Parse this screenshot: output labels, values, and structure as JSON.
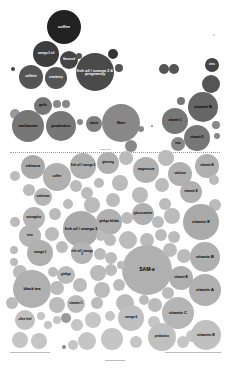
{
  "chart_data": {
    "type": "bubble",
    "title": "",
    "divider_label": "worth it line",
    "bubbles": [
      {
        "label": "coffee",
        "x": 64,
        "y": 27,
        "r": 17,
        "color": "#222222",
        "text": "#ffffff"
      },
      {
        "label": "omega-3 oil",
        "x": 46,
        "y": 54,
        "r": 13,
        "color": "#3d3d3d",
        "text": "#ffffff"
      },
      {
        "label": "flaxseed",
        "x": 69,
        "y": 60,
        "r": 9,
        "color": "#444444",
        "text": "#ffffff"
      },
      {
        "label": "",
        "x": 79,
        "y": 56,
        "r": 3,
        "color": "#555555",
        "text": "#ffffff"
      },
      {
        "label": "fish oil / omega 3 & pregnancy",
        "x": 95,
        "y": 72,
        "r": 19,
        "color": "#4a4a4a",
        "text": "#ffffff"
      },
      {
        "label": "",
        "x": 113,
        "y": 54,
        "r": 5,
        "color": "#333333",
        "text": "#ffffff"
      },
      {
        "label": "",
        "x": 119,
        "y": 68,
        "r": 4,
        "color": "#555555",
        "text": "#ffffff"
      },
      {
        "label": "",
        "x": 13,
        "y": 69,
        "r": 2,
        "color": "#444444",
        "text": "#ffffff"
      },
      {
        "label": "caffeine",
        "x": 31,
        "y": 77,
        "r": 12,
        "color": "#555555",
        "text": "#ffffff"
      },
      {
        "label": "cranberry",
        "x": 56,
        "y": 78,
        "r": 11,
        "color": "#555555",
        "text": "#ffffff"
      },
      {
        "label": "",
        "x": 164,
        "y": 69,
        "r": 5,
        "color": "#555555",
        "text": "#ffffff"
      },
      {
        "label": "",
        "x": 174,
        "y": 69,
        "r": 5,
        "color": "#555555",
        "text": "#ffffff"
      },
      {
        "label": "zinc",
        "x": 212,
        "y": 65,
        "r": 7,
        "color": "#444444",
        "text": "#ffffff"
      },
      {
        "label": "",
        "x": 211,
        "y": 84,
        "r": 9,
        "color": "#555555",
        "text": "#ffffff"
      },
      {
        "label": "vitamin B",
        "x": 203,
        "y": 107,
        "r": 15,
        "color": "#666666",
        "text": "#000000"
      },
      {
        "label": "",
        "x": 181,
        "y": 101,
        "r": 4,
        "color": "#777777",
        "text": "#000000"
      },
      {
        "label": "garlic",
        "x": 43,
        "y": 106,
        "r": 9,
        "color": "#777777",
        "text": "#000000"
      },
      {
        "label": "",
        "x": 57,
        "y": 104,
        "r": 4,
        "color": "#888888",
        "text": "#000000"
      },
      {
        "label": "",
        "x": 66,
        "y": 104,
        "r": 4,
        "color": "#888888",
        "text": "#000000"
      },
      {
        "label": "",
        "x": 15,
        "y": 114,
        "r": 5,
        "color": "#999999",
        "text": "#000000"
      },
      {
        "label": "melatonin",
        "x": 28,
        "y": 126,
        "r": 16,
        "color": "#777777",
        "text": "#000000"
      },
      {
        "label": "probiotics",
        "x": 61,
        "y": 126,
        "r": 15,
        "color": "#777777",
        "text": "#000000"
      },
      {
        "label": "",
        "x": 80,
        "y": 122,
        "r": 3,
        "color": "#888888",
        "text": "#000000"
      },
      {
        "label": "niacin",
        "x": 94,
        "y": 124,
        "r": 8,
        "color": "#808080",
        "text": "#000000"
      },
      {
        "label": "fiber",
        "x": 121,
        "y": 123,
        "r": 19,
        "color": "#888888",
        "text": "#000000"
      },
      {
        "label": "",
        "x": 141,
        "y": 129,
        "r": 3,
        "color": "#888888",
        "text": "#000000"
      },
      {
        "label": "",
        "x": 152,
        "y": 126,
        "r": 1,
        "color": "#888888",
        "text": "#000000"
      },
      {
        "label": "vitamin C",
        "x": 175,
        "y": 121,
        "r": 13,
        "color": "#777777",
        "text": "#000000"
      },
      {
        "label": "vitamin D",
        "x": 197,
        "y": 138,
        "r": 13,
        "color": "#777777",
        "text": "#000000"
      },
      {
        "label": "",
        "x": 216,
        "y": 125,
        "r": 4,
        "color": "#888888",
        "text": "#000000"
      },
      {
        "label": "",
        "x": 217,
        "y": 136,
        "r": 3,
        "color": "#888888",
        "text": "#000000"
      },
      {
        "label": "iron",
        "x": 178,
        "y": 144,
        "r": 7,
        "color": "#888888",
        "text": "#000000"
      },
      {
        "label": "green tea",
        "x": 131,
        "y": 146,
        "r": 6,
        "color": "#888888",
        "text": "#000000"
      },
      {
        "label": "",
        "x": 214,
        "y": 35,
        "r": 1,
        "color": "#cccccc",
        "text": "#000000"
      },
      {
        "label": "echinacea",
        "x": 33,
        "y": 167,
        "r": 12,
        "color": "#aaaaaa",
        "text": "#000000"
      },
      {
        "label": "",
        "x": 15,
        "y": 176,
        "r": 5,
        "color": "#bbbbbb",
        "text": "#000000"
      },
      {
        "label": "coffee",
        "x": 57,
        "y": 177,
        "r": 14,
        "color": "#b0b0b0",
        "text": "#000000"
      },
      {
        "label": "fish oil / omega 3",
        "x": 83,
        "y": 166,
        "r": 13,
        "color": "#b0b0b0",
        "text": "#000000"
      },
      {
        "label": "ginseng",
        "x": 108,
        "y": 163,
        "r": 11,
        "color": "#b0b0b0",
        "text": "#000000"
      },
      {
        "label": "",
        "x": 126,
        "y": 158,
        "r": 7,
        "color": "#bbbbbb",
        "text": "#000000"
      },
      {
        "label": "magnesium",
        "x": 146,
        "y": 170,
        "r": 13,
        "color": "#b0b0b0",
        "text": "#000000"
      },
      {
        "label": "",
        "x": 166,
        "y": 158,
        "r": 8,
        "color": "#bbbbbb",
        "text": "#000000"
      },
      {
        "label": "calcium",
        "x": 180,
        "y": 174,
        "r": 12,
        "color": "#b0b0b0",
        "text": "#000000"
      },
      {
        "label": "vitamin B",
        "x": 207,
        "y": 166,
        "r": 12,
        "color": "#b0b0b0",
        "text": "#000000"
      },
      {
        "label": "",
        "x": 29,
        "y": 190,
        "r": 6,
        "color": "#bbbbbb",
        "text": "#000000"
      },
      {
        "label": "selenium",
        "x": 43,
        "y": 197,
        "r": 9,
        "color": "#b5b5b5",
        "text": "#000000"
      },
      {
        "label": "",
        "x": 76,
        "y": 186,
        "r": 6,
        "color": "#bbbbbb",
        "text": "#000000"
      },
      {
        "label": "",
        "x": 87,
        "y": 193,
        "r": 6,
        "color": "#bbbbbb",
        "text": "#000000"
      },
      {
        "label": "",
        "x": 99,
        "y": 183,
        "r": 5,
        "color": "#bbbbbb",
        "text": "#000000"
      },
      {
        "label": "",
        "x": 120,
        "y": 183,
        "r": 8,
        "color": "#bbbbbb",
        "text": "#000000"
      },
      {
        "label": "",
        "x": 162,
        "y": 185,
        "r": 7,
        "color": "#bbbbbb",
        "text": "#000000"
      },
      {
        "label": "vitamin E",
        "x": 191,
        "y": 192,
        "r": 11,
        "color": "#b0b0b0",
        "text": "#000000"
      },
      {
        "label": "",
        "x": 214,
        "y": 180,
        "r": 5,
        "color": "#bbbbbb",
        "text": "#000000"
      },
      {
        "label": "",
        "x": 113,
        "y": 200,
        "r": 7,
        "color": "#bbbbbb",
        "text": "#000000"
      },
      {
        "label": "",
        "x": 68,
        "y": 204,
        "r": 5,
        "color": "#bbbbbb",
        "text": "#000000"
      },
      {
        "label": "",
        "x": 92,
        "y": 205,
        "r": 8,
        "color": "#bbbbbb",
        "text": "#000000"
      },
      {
        "label": "",
        "x": 140,
        "y": 195,
        "r": 8,
        "color": "#bbbbbb",
        "text": "#000000"
      },
      {
        "label": "glucosamine",
        "x": 143,
        "y": 214,
        "r": 11,
        "color": "#b0b0b0",
        "text": "#000000"
      },
      {
        "label": "",
        "x": 165,
        "y": 204,
        "r": 6,
        "color": "#bbbbbb",
        "text": "#000000"
      },
      {
        "label": "",
        "x": 215,
        "y": 205,
        "r": 6,
        "color": "#bbbbbb",
        "text": "#000000"
      },
      {
        "label": "astragalus",
        "x": 34,
        "y": 218,
        "r": 11,
        "color": "#b5b5b5",
        "text": "#000000"
      },
      {
        "label": "",
        "x": 55,
        "y": 214,
        "r": 6,
        "color": "#bbbbbb",
        "text": "#000000"
      },
      {
        "label": "fish oil / omega 3",
        "x": 81,
        "y": 229,
        "r": 18,
        "color": "#aaaaaa",
        "text": "#000000"
      },
      {
        "label": "ginkgo biloba",
        "x": 109,
        "y": 222,
        "r": 13,
        "color": "#b0b0b0",
        "text": "#000000"
      },
      {
        "label": "",
        "x": 127,
        "y": 218,
        "r": 6,
        "color": "#bbbbbb",
        "text": "#000000"
      },
      {
        "label": "",
        "x": 158,
        "y": 222,
        "r": 6,
        "color": "#bbbbbb",
        "text": "#000000"
      },
      {
        "label": "",
        "x": 172,
        "y": 216,
        "r": 8,
        "color": "#bbbbbb",
        "text": "#000000"
      },
      {
        "label": "vitamin E",
        "x": 201,
        "y": 222,
        "r": 18,
        "color": "#aaaaaa",
        "text": "#000000"
      },
      {
        "label": "",
        "x": 15,
        "y": 222,
        "r": 5,
        "color": "#bbbbbb",
        "text": "#000000"
      },
      {
        "label": "",
        "x": 52,
        "y": 234,
        "r": 7,
        "color": "#bbbbbb",
        "text": "#000000"
      },
      {
        "label": "",
        "x": 110,
        "y": 240,
        "r": 6,
        "color": "#bbbbbb",
        "text": "#000000"
      },
      {
        "label": "",
        "x": 128,
        "y": 240,
        "r": 9,
        "color": "#bbbbbb",
        "text": "#000000"
      },
      {
        "label": "",
        "x": 161,
        "y": 235,
        "r": 6,
        "color": "#bbbbbb",
        "text": "#000000"
      },
      {
        "label": "zinc",
        "x": 30,
        "y": 236,
        "r": 11,
        "color": "#b5b5b5",
        "text": "#000000"
      },
      {
        "label": "",
        "x": 101,
        "y": 236,
        "r": 5,
        "color": "#bbbbbb",
        "text": "#000000"
      },
      {
        "label": "",
        "x": 147,
        "y": 240,
        "r": 7,
        "color": "#bbbbbb",
        "text": "#000000"
      },
      {
        "label": "",
        "x": 174,
        "y": 237,
        "r": 6,
        "color": "#bbbbbb",
        "text": "#000000"
      },
      {
        "label": "",
        "x": 14,
        "y": 250,
        "r": 4,
        "color": "#bbbbbb",
        "text": "#000000"
      },
      {
        "label": "omega 3",
        "x": 40,
        "y": 253,
        "r": 13,
        "color": "#b0b0b0",
        "text": "#000000"
      },
      {
        "label": "",
        "x": 62,
        "y": 247,
        "r": 6,
        "color": "#bbbbbb",
        "text": "#000000"
      },
      {
        "label": "fish oil / omega 3",
        "x": 82,
        "y": 253,
        "r": 11,
        "color": "#b5b5b5",
        "text": "#000000"
      },
      {
        "label": "",
        "x": 100,
        "y": 254,
        "r": 6,
        "color": "#bbbbbb",
        "text": "#000000"
      },
      {
        "label": "",
        "x": 111,
        "y": 258,
        "r": 6,
        "color": "#bbbbbb",
        "text": "#000000"
      },
      {
        "label": "SAM-e",
        "x": 147,
        "y": 270,
        "r": 25,
        "color": "#b0b0b0",
        "text": "#000000"
      },
      {
        "label": "",
        "x": 170,
        "y": 250,
        "r": 7,
        "color": "#bbbbbb",
        "text": "#000000"
      },
      {
        "label": "",
        "x": 184,
        "y": 256,
        "r": 7,
        "color": "#bbbbbb",
        "text": "#000000"
      },
      {
        "label": "vitamin B",
        "x": 205,
        "y": 257,
        "r": 15,
        "color": "#b0b0b0",
        "text": "#000000"
      },
      {
        "label": "",
        "x": 14,
        "y": 262,
        "r": 4,
        "color": "#bbbbbb",
        "text": "#000000"
      },
      {
        "label": "",
        "x": 20,
        "y": 272,
        "r": 7,
        "color": "#bbbbbb",
        "text": "#000000"
      },
      {
        "label": "black tea",
        "x": 32,
        "y": 289,
        "r": 19,
        "color": "#b0b0b0",
        "text": "#000000"
      },
      {
        "label": "",
        "x": 53,
        "y": 272,
        "r": 5,
        "color": "#bbbbbb",
        "text": "#000000"
      },
      {
        "label": "ginkgo",
        "x": 66,
        "y": 275,
        "r": 9,
        "color": "#bbbbbb",
        "text": "#000000"
      },
      {
        "label": "",
        "x": 98,
        "y": 273,
        "r": 8,
        "color": "#bbbbbb",
        "text": "#000000"
      },
      {
        "label": "",
        "x": 111,
        "y": 270,
        "r": 6,
        "color": "#bbbbbb",
        "text": "#000000"
      },
      {
        "label": "",
        "x": 121,
        "y": 265,
        "r": 4,
        "color": "#bbbbbb",
        "text": "#000000"
      },
      {
        "label": "vitamin B",
        "x": 181,
        "y": 278,
        "r": 12,
        "color": "#b0b0b0",
        "text": "#000000"
      },
      {
        "label": "",
        "x": 57,
        "y": 288,
        "r": 7,
        "color": "#bbbbbb",
        "text": "#000000"
      },
      {
        "label": "",
        "x": 80,
        "y": 285,
        "r": 7,
        "color": "#bbbbbb",
        "text": "#000000"
      },
      {
        "label": "",
        "x": 102,
        "y": 290,
        "r": 8,
        "color": "#bbbbbb",
        "text": "#000000"
      },
      {
        "label": "",
        "x": 119,
        "y": 285,
        "r": 6,
        "color": "#bbbbbb",
        "text": "#000000"
      },
      {
        "label": "vitamin A",
        "x": 205,
        "y": 290,
        "r": 16,
        "color": "#b0b0b0",
        "text": "#000000"
      },
      {
        "label": "",
        "x": 168,
        "y": 293,
        "r": 6,
        "color": "#bbbbbb",
        "text": "#000000"
      },
      {
        "label": "",
        "x": 12,
        "y": 303,
        "r": 6,
        "color": "#bbbbbb",
        "text": "#000000"
      },
      {
        "label": "",
        "x": 57,
        "y": 305,
        "r": 8,
        "color": "#bbbbbb",
        "text": "#000000"
      },
      {
        "label": "vitamin C",
        "x": 76,
        "y": 304,
        "r": 9,
        "color": "#bbbbbb",
        "text": "#000000"
      },
      {
        "label": "",
        "x": 97,
        "y": 303,
        "r": 6,
        "color": "#bbbbbb",
        "text": "#000000"
      },
      {
        "label": "",
        "x": 125,
        "y": 303,
        "r": 9,
        "color": "#bbbbbb",
        "text": "#000000"
      },
      {
        "label": "",
        "x": 144,
        "y": 300,
        "r": 5,
        "color": "#bbbbbb",
        "text": "#000000"
      },
      {
        "label": "vitamin C",
        "x": 178,
        "y": 313,
        "r": 16,
        "color": "#b5b5b5",
        "text": "#000000"
      },
      {
        "label": "",
        "x": 155,
        "y": 305,
        "r": 7,
        "color": "#bbbbbb",
        "text": "#000000"
      },
      {
        "label": "olive leaf",
        "x": 25,
        "y": 320,
        "r": 10,
        "color": "#c0c0c0",
        "text": "#000000"
      },
      {
        "label": "",
        "x": 41,
        "y": 316,
        "r": 4,
        "color": "#c5c5c5",
        "text": "#000000"
      },
      {
        "label": "",
        "x": 48,
        "y": 325,
        "r": 4,
        "color": "#c5c5c5",
        "text": "#000000"
      },
      {
        "label": "",
        "x": 57,
        "y": 320,
        "r": 4,
        "color": "#c5c5c5",
        "text": "#000000"
      },
      {
        "label": "",
        "x": 66,
        "y": 318,
        "r": 5,
        "color": "#999999",
        "text": "#000000"
      },
      {
        "label": "kelp",
        "x": 77,
        "y": 325,
        "r": 6,
        "color": "#c5c5c5",
        "text": "#000000"
      },
      {
        "label": "",
        "x": 93,
        "y": 320,
        "r": 8,
        "color": "#c5c5c5",
        "text": "#000000"
      },
      {
        "label": "",
        "x": 110,
        "y": 316,
        "r": 5,
        "color": "#c5c5c5",
        "text": "#000000"
      },
      {
        "label": "omega 6",
        "x": 131,
        "y": 318,
        "r": 13,
        "color": "#c0c0c0",
        "text": "#000000"
      },
      {
        "label": "",
        "x": 154,
        "y": 322,
        "r": 6,
        "color": "#c5c5c5",
        "text": "#000000"
      },
      {
        "label": "",
        "x": 20,
        "y": 340,
        "r": 8,
        "color": "#c5c5c5",
        "text": "#000000"
      },
      {
        "label": "",
        "x": 39,
        "y": 341,
        "r": 8,
        "color": "#c5c5c5",
        "text": "#000000"
      },
      {
        "label": "",
        "x": 64,
        "y": 347,
        "r": 2,
        "color": "#888888",
        "text": "#000000"
      },
      {
        "label": "",
        "x": 73,
        "y": 345,
        "r": 5,
        "color": "#c5c5c5",
        "text": "#000000"
      },
      {
        "label": "",
        "x": 87,
        "y": 341,
        "r": 9,
        "color": "#c5c5c5",
        "text": "#000000"
      },
      {
        "label": "",
        "x": 112,
        "y": 339,
        "r": 11,
        "color": "#c5c5c5",
        "text": "#000000"
      },
      {
        "label": "",
        "x": 136,
        "y": 342,
        "r": 6,
        "color": "#c5c5c5",
        "text": "#000000"
      },
      {
        "label": "probiotics",
        "x": 162,
        "y": 337,
        "r": 14,
        "color": "#c0c0c0",
        "text": "#000000"
      },
      {
        "label": "",
        "x": 183,
        "y": 342,
        "r": 6,
        "color": "#c5c5c5",
        "text": "#000000"
      },
      {
        "label": "",
        "x": 192,
        "y": 336,
        "r": 6,
        "color": "#c5c5c5",
        "text": "#000000"
      },
      {
        "label": "vitamin E",
        "x": 206,
        "y": 335,
        "r": 15,
        "color": "#c0c0c0",
        "text": "#000000"
      }
    ],
    "footer_left": "",
    "footer_center": "",
    "footer_right": ""
  }
}
